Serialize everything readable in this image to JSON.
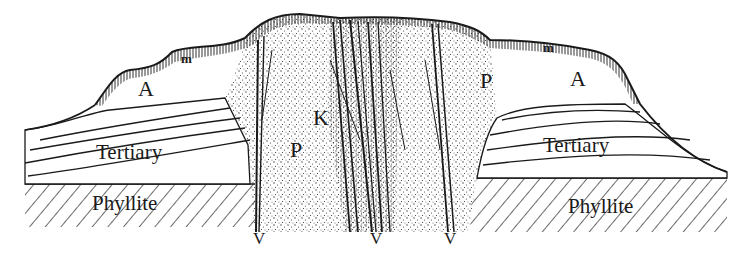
{
  "diagram": {
    "type": "geological-cross-section",
    "colors": {
      "ink": "#1a1a1a",
      "background": "#ffffff",
      "stipple": "#333333"
    },
    "labels": {
      "alluvium_left": "A",
      "alluvium_right": "A",
      "moraine_left": "m",
      "moraine_right": "m",
      "kimberlite": "K",
      "porphyry_left": "P",
      "porphyry_right": "P",
      "tertiary_left": "Tertiary",
      "tertiary_right": "Tertiary",
      "phyllite_left": "Phyllite",
      "phyllite_right": "Phyllite",
      "vein_1": "V",
      "vein_2": "V",
      "vein_3": "V"
    },
    "units": [
      {
        "key": "m",
        "pattern": "vertical-hatch",
        "position": "surface cap"
      },
      {
        "key": "A",
        "pattern": "blank",
        "position": "upper flanks"
      },
      {
        "key": "Tertiary",
        "pattern": "wavy-bedding",
        "position": "flanks"
      },
      {
        "key": "Phyllite",
        "pattern": "diagonal-hatch",
        "position": "base"
      },
      {
        "key": "P",
        "pattern": "stipple",
        "position": "central intrusion"
      },
      {
        "key": "K",
        "pattern": "dense vein lines",
        "position": "core"
      },
      {
        "key": "V",
        "pattern": "vertical veins",
        "position": "vein markers at base"
      }
    ]
  }
}
